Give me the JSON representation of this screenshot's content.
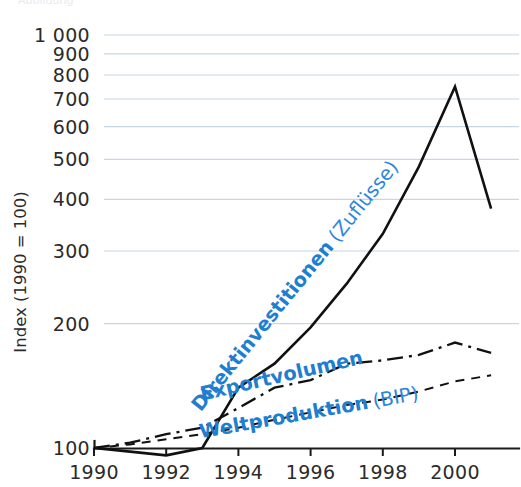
{
  "figure": {
    "background_color": "#ffffff",
    "accent_color": "#1f7ed0",
    "grid_color": "#c6d8e6",
    "line_color": "#111111",
    "cropped_header_text": "Abbildung"
  },
  "chart_data": {
    "type": "line",
    "title": "",
    "subtitle": "",
    "xlabel": "",
    "ylabel": "Index (1990 = 100)",
    "y_scale": "log",
    "ylim": [
      100,
      1000
    ],
    "xlim": [
      1990,
      2001
    ],
    "grid": true,
    "grid_axis": "y",
    "legend": "inline-annotations",
    "legend_position": "inline",
    "x": [
      1990,
      1991,
      1992,
      1993,
      1994,
      1995,
      1996,
      1997,
      1998,
      1999,
      2000,
      2001
    ],
    "xticks": [
      1990,
      1992,
      1994,
      1996,
      1998,
      2000
    ],
    "xticklabels": [
      "1990",
      "1992",
      "1994",
      "1996",
      "1998",
      "2000"
    ],
    "yticks": [
      100,
      200,
      300,
      400,
      500,
      600,
      700,
      800,
      900,
      1000
    ],
    "yticklabels": [
      "100",
      "200",
      "300",
      "400",
      "500",
      "600",
      "700",
      "800",
      "900",
      "1 000"
    ],
    "series": [
      {
        "name": "Direktinvestitionen (Zuflüsse)",
        "label_main": "Direktinvestitionen",
        "label_paren": "(Zuflüsse)",
        "style": "solid",
        "values": [
          100,
          98,
          96,
          100,
          140,
          160,
          196,
          250,
          330,
          480,
          750,
          380
        ]
      },
      {
        "name": "Exportvolumen",
        "label_main": "Exportvolumen",
        "label_paren": "",
        "style": "dash-dot",
        "values": [
          100,
          103,
          108,
          112,
          125,
          140,
          146,
          160,
          163,
          168,
          180,
          170
        ]
      },
      {
        "name": "Weltproduktion (BIP)",
        "label_main": "Weltproduktion",
        "label_paren": "(BIP)",
        "style": "dashed",
        "values": [
          100,
          102,
          105,
          108,
          112,
          117,
          122,
          127,
          131,
          137,
          145,
          150
        ]
      }
    ],
    "annotations": [
      {
        "id": "fdi-annotation",
        "text_main": "Direktinvestitionen",
        "text_paren": "(Zuflüsse)",
        "rotation": -51,
        "x": 300,
        "y": 290,
        "color": "#1f7ed0"
      },
      {
        "id": "export-annotation",
        "text_main": "Exportvolumen",
        "text_paren": "",
        "rotation": -13,
        "x": 283,
        "y": 382,
        "color": "#1f7ed0"
      },
      {
        "id": "gdp-annotation",
        "text_main": "Weltproduktion",
        "text_paren": "(BIP)",
        "rotation": -10,
        "x": 310,
        "y": 419,
        "color": "#1f7ed0"
      }
    ]
  }
}
